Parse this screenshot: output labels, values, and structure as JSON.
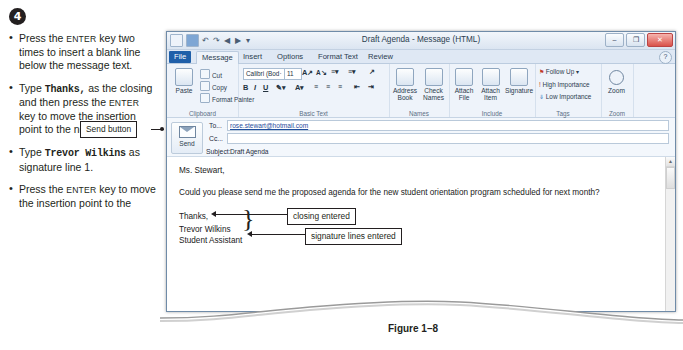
{
  "instructions": {
    "step_number": "4",
    "bullets": [
      {
        "id": "b1",
        "parts": [
          {
            "t": "Press the ",
            "s": "n"
          },
          {
            "t": "ENTER",
            "s": "k"
          },
          {
            "t": " key two times to insert a blank line below the message text.",
            "s": "n"
          }
        ]
      },
      {
        "id": "b2",
        "parts": [
          {
            "t": "Type ",
            "s": "n"
          },
          {
            "t": "Thanks,",
            "s": "m"
          },
          {
            "t": " as the closing and then press the ",
            "s": "n"
          },
          {
            "t": "ENTER",
            "s": "k"
          },
          {
            "t": " key to move the insertion point to the next line.",
            "s": "n"
          }
        ]
      },
      {
        "id": "b3",
        "parts": [
          {
            "t": "Type ",
            "s": "n"
          },
          {
            "t": "Trevor Wilkins",
            "s": "m"
          },
          {
            "t": " as signature line 1.",
            "s": "n"
          }
        ]
      },
      {
        "id": "b4",
        "parts": [
          {
            "t": "Press the ",
            "s": "n"
          },
          {
            "t": "ENTER",
            "s": "k"
          },
          {
            "t": " key to move the insertion point to the",
            "s": "n"
          }
        ]
      }
    ]
  },
  "callouts": {
    "send_button": "Send button",
    "closing_entered": "closing entered",
    "signature_lines_entered": "signature lines entered"
  },
  "figure": {
    "caption": "Figure 1–8"
  },
  "window": {
    "title": "Draft Agenda  -  Message (HTML)",
    "quick_access": [
      "outlook-icon",
      "save-icon",
      "undo-icon",
      "redo-icon",
      "previous-icon",
      "next-icon",
      "customize-icon"
    ],
    "controls": {
      "minimize": "–",
      "maximize": "❐",
      "close": "✕",
      "help": "?"
    },
    "tabs": [
      {
        "id": "file",
        "label": "File"
      },
      {
        "id": "message",
        "label": "Message"
      },
      {
        "id": "insert",
        "label": "Insert"
      },
      {
        "id": "options",
        "label": "Options"
      },
      {
        "id": "format-text",
        "label": "Format Text"
      },
      {
        "id": "review",
        "label": "Review"
      }
    ],
    "active_tab": "Message",
    "ribbon": {
      "groups": [
        {
          "id": "clipboard",
          "label": "Clipboard",
          "big": [
            {
              "id": "paste",
              "label": "Paste"
            }
          ],
          "small": [
            {
              "id": "cut",
              "label": "Cut"
            },
            {
              "id": "copy",
              "label": "Copy"
            },
            {
              "id": "format-painter",
              "label": "Format Painter"
            }
          ]
        },
        {
          "id": "basic-text",
          "label": "Basic Text",
          "font_name": "Calibri (Bod·",
          "font_size": "11",
          "small": [
            {
              "id": "grow-font",
              "label": "A"
            },
            {
              "id": "shrink-font",
              "label": "A"
            }
          ]
        },
        {
          "id": "names",
          "label": "Names",
          "big": [
            {
              "id": "address-book",
              "label": "Address Book"
            },
            {
              "id": "check-names",
              "label": "Check Names"
            }
          ]
        },
        {
          "id": "include",
          "label": "Include",
          "big": [
            {
              "id": "attach-file",
              "label": "Attach File"
            },
            {
              "id": "attach-item",
              "label": "Attach Item"
            },
            {
              "id": "signature",
              "label": "Signature"
            }
          ]
        },
        {
          "id": "tags",
          "label": "Tags",
          "small": [
            {
              "id": "follow-up",
              "label": "Follow Up"
            },
            {
              "id": "high-importance",
              "label": "High Importance"
            },
            {
              "id": "low-importance",
              "label": "Low Importance"
            }
          ]
        },
        {
          "id": "zoom",
          "label": "Zoom",
          "big": [
            {
              "id": "zoom",
              "label": "Zoom"
            }
          ]
        }
      ]
    },
    "compose": {
      "send_label": "Send",
      "to_label": "To...",
      "cc_label": "Cc...",
      "subject_label": "Subject:",
      "to_value": "rose.stewart@hotmail.com",
      "cc_value": "",
      "subject_value": "Draft Agenda"
    },
    "message_body": {
      "salutation": "Ms. Stewart,",
      "paragraph": "Could you please send me the proposed agenda for the new student orientation program scheduled for next month?",
      "closing": "Thanks,",
      "signature_line_1": "Trevor Wilkins",
      "signature_line_2": "Student Assistant"
    }
  }
}
